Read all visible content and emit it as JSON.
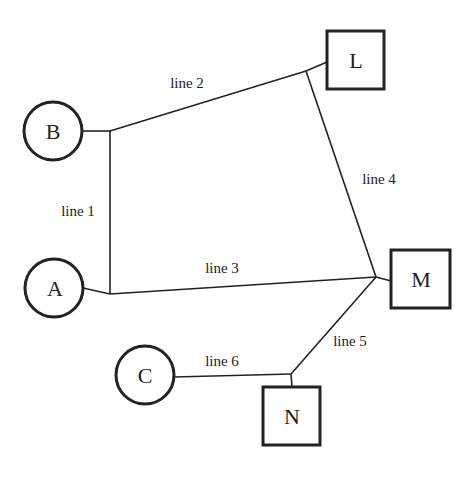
{
  "diagram": {
    "colors": {
      "stroke": "#222222",
      "background": "#ffffff"
    },
    "nodes": [
      {
        "id": "B",
        "label": "B",
        "shape": "circle"
      },
      {
        "id": "A",
        "label": "A",
        "shape": "circle"
      },
      {
        "id": "C",
        "label": "C",
        "shape": "circle"
      },
      {
        "id": "L",
        "label": "L",
        "shape": "square"
      },
      {
        "id": "M",
        "label": "M",
        "shape": "square"
      },
      {
        "id": "N",
        "label": "N",
        "shape": "square"
      }
    ],
    "edges": [
      {
        "id": "line1",
        "label": "line 1",
        "connects": [
          "B",
          "A"
        ]
      },
      {
        "id": "line2",
        "label": "line 2",
        "connects": [
          "B",
          "L"
        ]
      },
      {
        "id": "line3",
        "label": "line 3",
        "connects": [
          "A",
          "M"
        ]
      },
      {
        "id": "line4",
        "label": "line 4",
        "connects": [
          "L",
          "M"
        ]
      },
      {
        "id": "line5",
        "label": "line 5",
        "connects": [
          "M",
          "N"
        ]
      },
      {
        "id": "line6",
        "label": "line 6",
        "connects": [
          "C",
          "N"
        ]
      }
    ]
  }
}
